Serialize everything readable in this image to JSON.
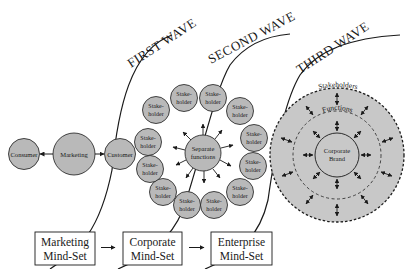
{
  "diagram": {
    "waves": [
      {
        "label": "FIRST WAVE"
      },
      {
        "label": "SECOND WAVE"
      },
      {
        "label": "THIRD WAVE"
      }
    ],
    "first_wave": {
      "nodes": [
        {
          "label": "Consumer"
        },
        {
          "label": "Marketing"
        },
        {
          "label": "Customer"
        }
      ]
    },
    "second_wave": {
      "center": {
        "line1": "Separate",
        "line2": "functions"
      },
      "stakeholder": {
        "line1": "Stake-",
        "line2": "holder"
      },
      "stakeholder_count": 14
    },
    "third_wave": {
      "outer_ring_label": "Stakeholders",
      "inner_ring_label": "Functions",
      "center": {
        "line1": "Corporate",
        "line2": "Brand"
      }
    },
    "mindsets": [
      {
        "line1": "Marketing",
        "line2": "Mind-Set"
      },
      {
        "line1": "Corporate",
        "line2": "Mind-Set"
      },
      {
        "line1": "Enterprise",
        "line2": "Mind-Set"
      }
    ],
    "colors": {
      "node_fill": "#b9b9b9",
      "ring_fill": "#c8c8c8",
      "stroke": "#1a1a1a",
      "background": "#ffffff"
    }
  }
}
